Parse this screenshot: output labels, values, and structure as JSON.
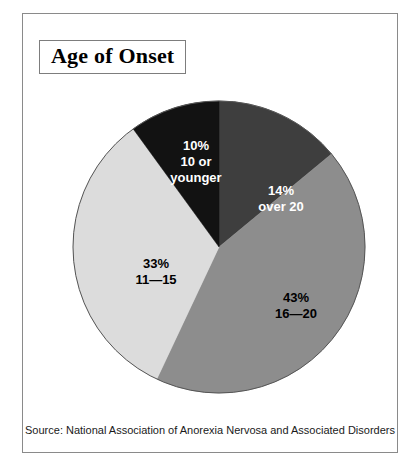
{
  "figure": {
    "title": "Age of Onset",
    "source": "Source: National Association of Anorexia Nervosa and Associated Disorders"
  },
  "chart_data": {
    "type": "pie",
    "title": "Age of Onset",
    "xlabel": "",
    "ylabel": "",
    "units": "percent",
    "start_angle_deg": 0,
    "direction": "clockwise",
    "legend": "none (labels drawn inside slices)",
    "categories": [
      "over 20",
      "16—20",
      "11—15",
      "10 or younger"
    ],
    "values": [
      14,
      43,
      33,
      10
    ],
    "slices": [
      {
        "label": "over 20",
        "value": 14,
        "percent_text": "14%",
        "color": "#3e3e3e",
        "text_color": "#ffffff",
        "label_x": 258,
        "label_y": 185
      },
      {
        "label": "16—20",
        "value": 43,
        "percent_text": "43%",
        "color": "#8d8d8d",
        "text_color": "#000000",
        "label_x": 273,
        "label_y": 292
      },
      {
        "label": "11—15",
        "value": 33,
        "percent_text": "33%",
        "color": "#dcdcdc",
        "text_color": "#000000",
        "label_x": 133,
        "label_y": 258
      },
      {
        "label": "10 or younger",
        "value": 10,
        "percent_text": "10%",
        "color": "#121212",
        "text_color": "#ffffff",
        "label_x": 173,
        "label_y": 148
      }
    ],
    "geometry": {
      "center_x": 196,
      "center_y": 233,
      "radius": 146,
      "outline_color": "#555555"
    }
  }
}
